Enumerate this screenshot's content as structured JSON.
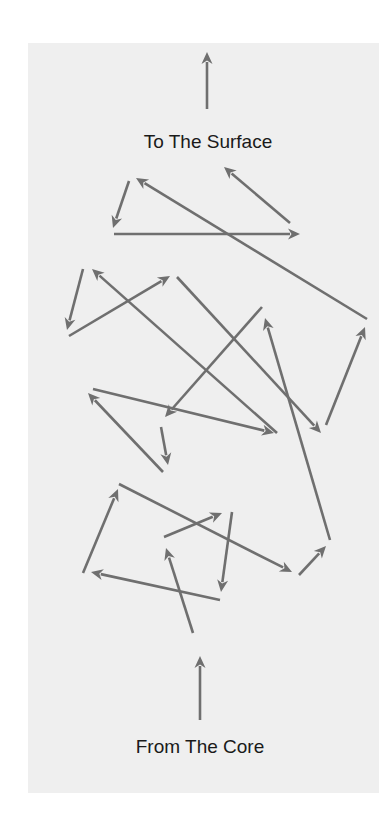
{
  "diagram": {
    "title_top": "To The Surface",
    "title_bottom": "From The Core",
    "colors": {
      "page_background": "#ffffff",
      "panel_background": "#efefef",
      "arrow": "#6f6f6f",
      "text": "#1a1a1a"
    },
    "arrows": [
      {
        "id": "surface-arrow",
        "x1": 207,
        "y1": 109,
        "x2": 207,
        "y2": 52
      },
      {
        "id": "core-arrow",
        "x1": 200,
        "y1": 720,
        "x2": 200,
        "y2": 656
      },
      {
        "id": "a",
        "x1": 129,
        "y1": 181,
        "x2": 113,
        "y2": 228
      },
      {
        "id": "b",
        "x1": 114,
        "y1": 234,
        "x2": 300,
        "y2": 234
      },
      {
        "id": "c",
        "x1": 290,
        "y1": 223,
        "x2": 224,
        "y2": 167
      },
      {
        "id": "d",
        "x1": 367,
        "y1": 319,
        "x2": 136,
        "y2": 178
      },
      {
        "id": "e",
        "x1": 83,
        "y1": 269,
        "x2": 67,
        "y2": 330
      },
      {
        "id": "f",
        "x1": 69,
        "y1": 336,
        "x2": 170,
        "y2": 276
      },
      {
        "id": "g",
        "x1": 277,
        "y1": 433,
        "x2": 92,
        "y2": 269
      },
      {
        "id": "h",
        "x1": 177,
        "y1": 277,
        "x2": 321,
        "y2": 433
      },
      {
        "id": "i",
        "x1": 262,
        "y1": 307,
        "x2": 165,
        "y2": 417
      },
      {
        "id": "j",
        "x1": 93,
        "y1": 389,
        "x2": 274,
        "y2": 433
      },
      {
        "id": "k",
        "x1": 163,
        "y1": 472,
        "x2": 88,
        "y2": 393
      },
      {
        "id": "l",
        "x1": 161,
        "y1": 427,
        "x2": 168,
        "y2": 465
      },
      {
        "id": "m",
        "x1": 326,
        "y1": 425,
        "x2": 365,
        "y2": 327
      },
      {
        "id": "n",
        "x1": 330,
        "y1": 540,
        "x2": 265,
        "y2": 318
      },
      {
        "id": "o",
        "x1": 83,
        "y1": 573,
        "x2": 118,
        "y2": 489
      },
      {
        "id": "p",
        "x1": 119,
        "y1": 484,
        "x2": 292,
        "y2": 572
      },
      {
        "id": "q",
        "x1": 164,
        "y1": 537,
        "x2": 222,
        "y2": 513
      },
      {
        "id": "r",
        "x1": 232,
        "y1": 512,
        "x2": 221,
        "y2": 592
      },
      {
        "id": "s",
        "x1": 220,
        "y1": 600,
        "x2": 91,
        "y2": 572
      },
      {
        "id": "t",
        "x1": 193,
        "y1": 633,
        "x2": 166,
        "y2": 548
      },
      {
        "id": "u",
        "x1": 299,
        "y1": 575,
        "x2": 326,
        "y2": 546
      }
    ]
  }
}
